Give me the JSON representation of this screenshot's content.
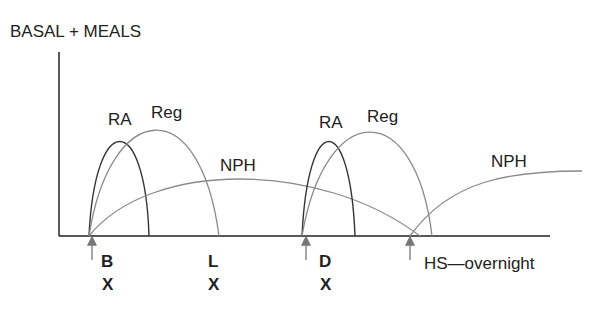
{
  "title": "BASAL + MEALS",
  "curves": {
    "ra1": "RA",
    "reg1": "Reg",
    "nph1": "NPH",
    "ra2": "RA",
    "reg2": "Reg",
    "nph2": "NPH"
  },
  "meals": [
    {
      "time": "B",
      "mark": "X"
    },
    {
      "time": "L",
      "mark": "X"
    },
    {
      "time": "D",
      "mark": "X"
    }
  ],
  "hs_label": "HS—overnight",
  "colors": {
    "dark": "#333333",
    "light": "#8a8a8a",
    "axis": "#222222"
  }
}
